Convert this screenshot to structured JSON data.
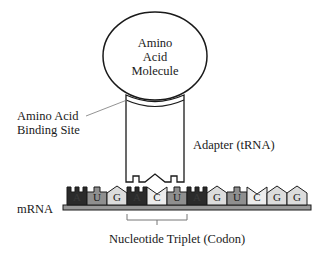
{
  "amino_acid": {
    "label_lines": [
      "Amino",
      "Acid",
      "Molecule"
    ]
  },
  "binding_site": {
    "label_lines": [
      "Amino Acid",
      "Binding Site"
    ]
  },
  "adapter": {
    "label": "Adapter (tRNA)"
  },
  "mrna": {
    "label": "mRNA",
    "nucleotides": [
      "A",
      "U",
      "G",
      "A",
      "C",
      "U",
      "A",
      "G",
      "U",
      "C",
      "G",
      "G"
    ]
  },
  "codon": {
    "label": "Nucleotide Triplet (Codon)"
  },
  "colors": {
    "A": "#2b2b2b",
    "U": "#8f8f8f",
    "G": "#dcdcdc",
    "C": "#ececec",
    "outline": "#1a1a1a"
  }
}
